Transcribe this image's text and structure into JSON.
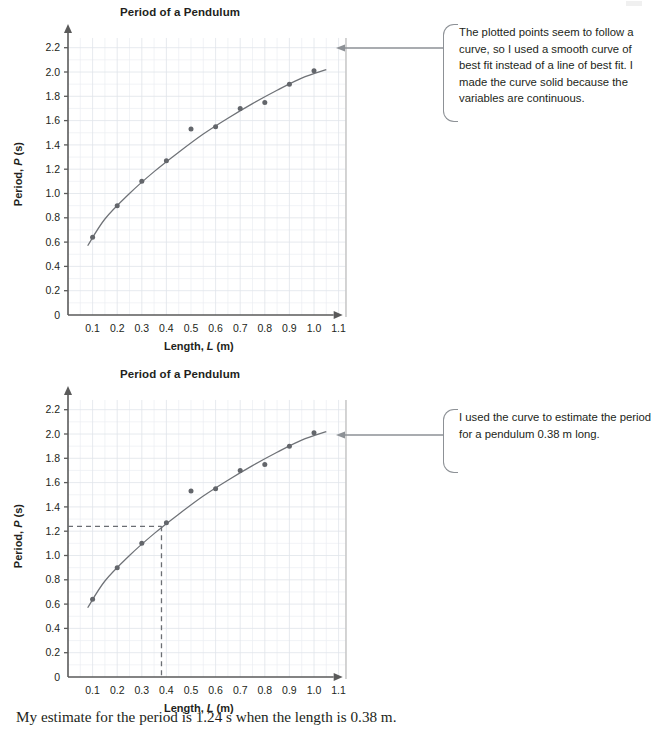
{
  "page": {
    "footnote": "My estimate for the period is 1.24 s when the length is 0.38 m."
  },
  "charts": [
    {
      "id": "chart-1",
      "title": "Period of a Pendulum",
      "xlabel_prefix": "Length,",
      "xlabel_var": "L",
      "xlabel_unit": "(m)",
      "ylabel_prefix": "Period,",
      "ylabel_var": "P",
      "ylabel_unit": "(s)",
      "callout": "The plotted points seem to follow a curve, so I used a smooth curve of best fit instead of a line of best fit. I made the curve solid because the variables are continuous."
    },
    {
      "id": "chart-2",
      "title": "Period of a Pendulum",
      "xlabel_prefix": "Length,",
      "xlabel_var": "L",
      "xlabel_unit": "(m)",
      "ylabel_prefix": "Period,",
      "ylabel_var": "P",
      "ylabel_unit": "(s)",
      "callout": "I used the curve to estimate the period for a pendulum 0.38 m long."
    }
  ],
  "chart_data": [
    {
      "type": "scatter",
      "title": "Period of a Pendulum",
      "xlabel": "Length, L (m)",
      "ylabel": "Period, P (s)",
      "xlim": [
        0,
        1.15
      ],
      "ylim": [
        0,
        2.3
      ],
      "xticks": [
        0.1,
        0.2,
        0.3,
        0.4,
        0.5,
        0.6,
        0.7,
        0.8,
        0.9,
        1.0,
        1.1
      ],
      "xticklabels": [
        "0.1",
        "0.2",
        "0.3",
        "0.4",
        "0.5",
        "0.6",
        "0.7",
        "0.8",
        "0.9",
        "1.0",
        "1.1"
      ],
      "yticks": [
        0,
        0.2,
        0.4,
        0.6,
        0.8,
        1.0,
        1.2,
        1.4,
        1.6,
        1.8,
        2.0,
        2.2
      ],
      "yticklabels": [
        "0",
        "0.2",
        "0.4",
        "0.6",
        "0.8",
        "1.0",
        "1.2",
        "1.4",
        "1.6",
        "1.8",
        "2.0",
        "2.2"
      ],
      "grid": true,
      "grid_minor_step_x": 0.05,
      "grid_minor_step_y": 0.1,
      "legend": null,
      "x": [
        0.1,
        0.2,
        0.3,
        0.4,
        0.5,
        0.6,
        0.7,
        0.8,
        0.9,
        1.0
      ],
      "y": [
        0.64,
        0.9,
        1.1,
        1.27,
        1.53,
        1.55,
        1.7,
        1.75,
        1.9,
        2.01
      ],
      "fit_curve": {
        "kind": "curve-of-best-fit",
        "style": "solid",
        "x": [
          0.08,
          0.15,
          0.25,
          0.35,
          0.45,
          0.55,
          0.65,
          0.75,
          0.85,
          0.95,
          1.05
        ],
        "y": [
          0.57,
          0.79,
          1.0,
          1.18,
          1.34,
          1.49,
          1.62,
          1.74,
          1.85,
          1.95,
          2.02
        ]
      },
      "estimate_lines": null
    },
    {
      "type": "scatter",
      "title": "Period of a Pendulum",
      "xlabel": "Length, L (m)",
      "ylabel": "Period, P (s)",
      "xlim": [
        0,
        1.15
      ],
      "ylim": [
        0,
        2.3
      ],
      "xticks": [
        0.1,
        0.2,
        0.3,
        0.4,
        0.5,
        0.6,
        0.7,
        0.8,
        0.9,
        1.0,
        1.1
      ],
      "xticklabels": [
        "0.1",
        "0.2",
        "0.3",
        "0.4",
        "0.5",
        "0.6",
        "0.7",
        "0.8",
        "0.9",
        "1.0",
        "1.1"
      ],
      "yticks": [
        0,
        0.2,
        0.4,
        0.6,
        0.8,
        1.0,
        1.2,
        1.4,
        1.6,
        1.8,
        2.0,
        2.2
      ],
      "yticklabels": [
        "0",
        "0.2",
        "0.4",
        "0.6",
        "0.8",
        "1.0",
        "1.2",
        "1.4",
        "1.6",
        "1.8",
        "2.0",
        "2.2"
      ],
      "grid": true,
      "grid_minor_step_x": 0.05,
      "grid_minor_step_y": 0.1,
      "legend": null,
      "x": [
        0.1,
        0.2,
        0.3,
        0.4,
        0.5,
        0.6,
        0.7,
        0.8,
        0.9,
        1.0
      ],
      "y": [
        0.64,
        0.9,
        1.1,
        1.27,
        1.53,
        1.55,
        1.7,
        1.75,
        1.9,
        2.01
      ],
      "fit_curve": {
        "kind": "curve-of-best-fit",
        "style": "solid",
        "x": [
          0.08,
          0.15,
          0.25,
          0.35,
          0.45,
          0.55,
          0.65,
          0.75,
          0.85,
          0.95,
          1.05
        ],
        "y": [
          0.57,
          0.79,
          1.0,
          1.18,
          1.34,
          1.49,
          1.62,
          1.74,
          1.85,
          1.95,
          2.02
        ]
      },
      "estimate_lines": {
        "style": "dashed",
        "x_value": 0.38,
        "y_value": 1.24
      }
    }
  ]
}
